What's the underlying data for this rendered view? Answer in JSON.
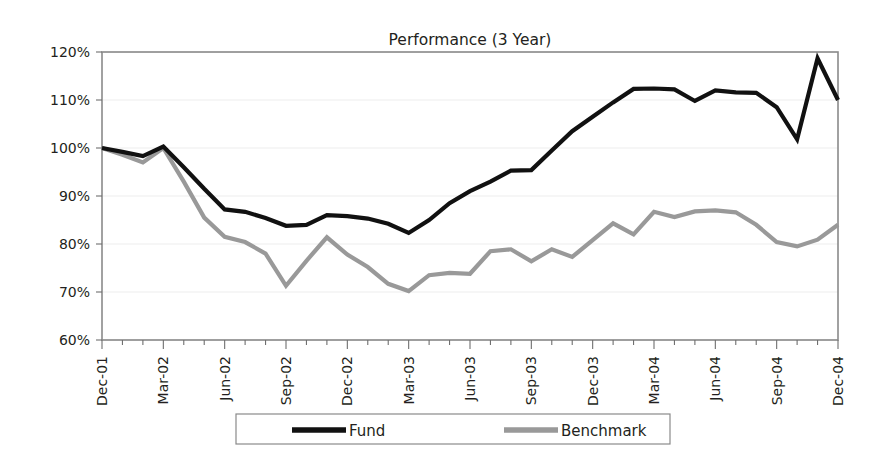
{
  "chart_data": {
    "type": "line",
    "title": "Performance (3 Year)",
    "xlabel": "",
    "ylabel": "",
    "ylim": [
      60,
      120
    ],
    "ytick_step": 10,
    "ytick_labels": [
      "120%",
      "110%",
      "100%",
      "90%",
      "80%",
      "70%",
      "60%"
    ],
    "ytick_values": [
      120,
      110,
      100,
      90,
      80,
      70,
      60
    ],
    "grid": true,
    "legend_position": "bottom",
    "x": [
      "Dec-01",
      "Jan-02",
      "Feb-02",
      "Mar-02",
      "Apr-02",
      "May-02",
      "Jun-02",
      "Jul-02",
      "Aug-02",
      "Sep-02",
      "Oct-02",
      "Nov-02",
      "Dec-02",
      "Jan-03",
      "Feb-03",
      "Mar-03",
      "Apr-03",
      "May-03",
      "Jun-03",
      "Jul-03",
      "Aug-03",
      "Sep-03",
      "Oct-03",
      "Nov-03",
      "Dec-03",
      "Jan-04",
      "Feb-04",
      "Mar-04",
      "Apr-04",
      "May-04",
      "Jun-04",
      "Jul-04",
      "Aug-04",
      "Sep-04",
      "Oct-04",
      "Nov-04",
      "Dec-04"
    ],
    "xtick_labels": [
      "Dec-01",
      "Mar-02",
      "Jun-02",
      "Sep-02",
      "Dec-02",
      "Mar-03",
      "Jun-03",
      "Sep-03",
      "Dec-03",
      "Mar-04",
      "Jun-04",
      "Sep-04",
      "Dec-04"
    ],
    "xtick_indices": [
      0,
      3,
      6,
      9,
      12,
      15,
      18,
      21,
      24,
      27,
      30,
      33,
      36
    ],
    "series": [
      {
        "name": "Fund",
        "color": "#111111",
        "width": 4.2,
        "values": [
          100.0,
          99.2,
          98.3,
          100.3,
          96.0,
          91.5,
          87.2,
          86.7,
          85.4,
          83.8,
          84.0,
          86.0,
          85.8,
          85.3,
          84.2,
          82.3,
          85.0,
          88.5,
          91.0,
          93.0,
          95.3,
          95.4,
          99.5,
          103.5,
          106.5,
          109.5,
          112.3,
          112.4,
          112.2,
          109.8,
          112.0,
          111.6,
          111.5,
          108.5,
          101.8,
          118.7,
          110.0
        ]
      },
      {
        "name": "Benchmark",
        "color": "#999999",
        "width": 4.2,
        "values": [
          100.0,
          98.6,
          97.0,
          100.0,
          93.0,
          85.5,
          81.5,
          80.4,
          78.0,
          71.3,
          76.5,
          81.4,
          77.8,
          75.2,
          71.7,
          70.2,
          73.5,
          74.0,
          73.8,
          78.5,
          78.9,
          76.4,
          78.9,
          77.3,
          80.8,
          84.3,
          82.0,
          86.7,
          85.6,
          86.8,
          87.0,
          86.6,
          84.0,
          80.4,
          79.5,
          80.9,
          84.0
        ]
      }
    ]
  },
  "legend": {
    "items": [
      {
        "label": "Fund",
        "color": "#111111"
      },
      {
        "label": "Benchmark",
        "color": "#999999"
      }
    ]
  }
}
